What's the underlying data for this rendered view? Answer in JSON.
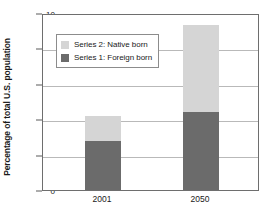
{
  "chart_data": {
    "type": "bar",
    "subtype": "stacked-bar",
    "title": "",
    "subtitle": "",
    "xlabel": "",
    "ylabel": "Percentage of total U.S. population",
    "categories": [
      "2001",
      "2050"
    ],
    "series": [
      {
        "name": "Series 1: Foreign born",
        "color": "#6b6b6b",
        "values": [
          2.75,
          4.4
        ]
      },
      {
        "name": "Series 2: Native born",
        "color": "#d5d5d5",
        "values": [
          1.45,
          4.9
        ]
      }
    ],
    "stack_totals": [
      4.2,
      9.3
    ],
    "ylim": [
      0,
      10
    ],
    "yticks": [
      0,
      2,
      4,
      6,
      8,
      10
    ],
    "ytick_labels": [
      "0",
      "2",
      "4",
      "6",
      "8",
      "10"
    ],
    "grid": true,
    "grid_axis": "y",
    "legend_position": "upper-left-inside",
    "legend_entries": [
      {
        "label": "Series 2: Native born",
        "color": "#d5d5d5"
      },
      {
        "label": "Series 1: Foreign born",
        "color": "#6b6b6b"
      }
    ],
    "colors": {
      "foreign_born": "#6b6b6b",
      "native_born": "#d5d5d5",
      "gridline": "#b9b9b9",
      "axis": "#6e6e6e",
      "text": "#1a1a1a",
      "background": "#ffffff"
    }
  }
}
